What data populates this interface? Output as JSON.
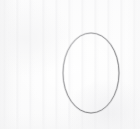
{
  "canvas": {
    "width": 140,
    "height": 129,
    "background_color": "#fdfdfd",
    "paper_tint_color": "#f4f4f5",
    "description": "Scanned white paper with faint vertical streaks"
  },
  "figure": {
    "shape_kind": "ellipse",
    "stroke_color": "#8d8d8d",
    "stroke_color_light": "#b4b4b6",
    "stroke_width": 1,
    "fill": "none",
    "center_x": 91,
    "center_y": 73,
    "radius_x": 28,
    "radius_y": 40,
    "bounds": {
      "left": 63,
      "top": 33,
      "right": 119,
      "bottom": 113,
      "width": 56,
      "height": 80
    }
  },
  "chart_data": {
    "type": "scatter",
    "subtitle": "",
    "xlabel": "",
    "ylabel": "",
    "xlim": [
      0,
      140
    ],
    "ylim": [
      0,
      129
    ],
    "grid": false,
    "legend": "none",
    "annotations": [],
    "tick_labels": {
      "x": [],
      "y": []
    },
    "series": [
      {
        "name": "ellipse",
        "shape": "ellipse",
        "center": [
          91,
          73
        ],
        "semi_axis_x": 28,
        "semi_axis_y": 40,
        "rotation_deg": 0,
        "closed": true,
        "stroke": "#8d8d8d"
      }
    ]
  }
}
